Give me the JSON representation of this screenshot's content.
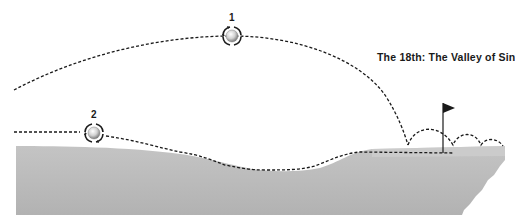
{
  "title": "The 18th: The Valley of Sin",
  "colors": {
    "background": "#ffffff",
    "ground": "#b8b8b8",
    "ground_top": "#c9c9c9",
    "trajectory": "#1a1a1a"
  },
  "shots": [
    {
      "label": "1",
      "description": "high lofted approach landing on green and bouncing past the flag",
      "icon": "golf-ball-spin-icon"
    },
    {
      "label": "2",
      "description": "low running shot following the contour through the Valley of Sin onto the green",
      "icon": "golf-ball-spin-icon"
    }
  ],
  "features": {
    "flag": "flag-icon",
    "terrain": "valley-of-sin-ground-profile"
  }
}
